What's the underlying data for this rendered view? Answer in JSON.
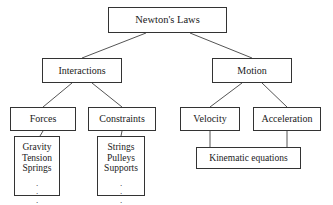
{
  "diagram": {
    "type": "hierarchy-tree",
    "style": {
      "box_border_color": "#333333",
      "box_fill_color": "#ffffff",
      "edge_color": "#555555",
      "text_color": "#1a1a1a",
      "background": "#ffffff"
    },
    "nodes": [
      {
        "id": "newtons-laws",
        "label": "Newton's Laws",
        "level": 0,
        "x": 108,
        "y": 7,
        "w": 119,
        "h": 26,
        "font_size": 10.5
      },
      {
        "id": "interactions",
        "label": "Interactions",
        "level": 1,
        "x": 42,
        "y": 58,
        "w": 80,
        "h": 25,
        "font_size": 10
      },
      {
        "id": "motion",
        "label": "Motion",
        "level": 1,
        "x": 212,
        "y": 58,
        "w": 80,
        "h": 25,
        "font_size": 10
      },
      {
        "id": "forces",
        "label": "Forces",
        "level": 2,
        "x": 10,
        "y": 107,
        "w": 66,
        "h": 24,
        "font_size": 10
      },
      {
        "id": "constraints",
        "label": "Constraints",
        "level": 2,
        "x": 88,
        "y": 107,
        "w": 68,
        "h": 24,
        "font_size": 10
      },
      {
        "id": "velocity",
        "label": "Velocity",
        "level": 2,
        "x": 180,
        "y": 107,
        "w": 60,
        "h": 24,
        "font_size": 10
      },
      {
        "id": "acceleration",
        "label": "Acceleration",
        "level": 2,
        "x": 253,
        "y": 107,
        "w": 68,
        "h": 24,
        "font_size": 10
      },
      {
        "id": "force-types",
        "label_lines": [
          "Gravity",
          "Tension",
          "Springs"
        ],
        "ellipsis": "vertical-dots",
        "level": 3,
        "x": 14,
        "y": 136,
        "w": 46,
        "h": 60,
        "font_size": 9.5
      },
      {
        "id": "constraint-types",
        "label_lines": [
          "Strings",
          "Pulleys",
          "Supports"
        ],
        "ellipsis": "vertical-dots",
        "level": 3,
        "x": 97,
        "y": 136,
        "w": 48,
        "h": 60,
        "font_size": 9.5
      },
      {
        "id": "kinematic-equations",
        "label": "Kinematic equations",
        "level": 3,
        "x": 196,
        "y": 147,
        "w": 105,
        "h": 22,
        "font_size": 9.5
      }
    ],
    "edges": [
      {
        "from": "newtons-laws",
        "to": "interactions",
        "style": "diagonal",
        "x1": 146,
        "y1": 33,
        "x2": 82,
        "y2": 58
      },
      {
        "from": "newtons-laws",
        "to": "motion",
        "style": "diagonal",
        "x1": 190,
        "y1": 33,
        "x2": 252,
        "y2": 58
      },
      {
        "from": "interactions",
        "to": "forces",
        "style": "diagonal",
        "x1": 72,
        "y1": 83,
        "x2": 43,
        "y2": 107
      },
      {
        "from": "interactions",
        "to": "constraints",
        "style": "diagonal",
        "x1": 92,
        "y1": 83,
        "x2": 122,
        "y2": 107
      },
      {
        "from": "motion",
        "to": "velocity",
        "style": "diagonal",
        "x1": 242,
        "y1": 83,
        "x2": 210,
        "y2": 107
      },
      {
        "from": "motion",
        "to": "acceleration",
        "style": "diagonal",
        "x1": 262,
        "y1": 83,
        "x2": 287,
        "y2": 107
      },
      {
        "from": "forces",
        "to": "force-types",
        "style": "vertical",
        "x1": 43,
        "y1": 131,
        "x2": 37,
        "y2": 136
      },
      {
        "from": "constraints",
        "to": "constraint-types",
        "style": "vertical",
        "x1": 122,
        "y1": 131,
        "x2": 121,
        "y2": 136
      },
      {
        "from": "velocity",
        "to": "kinematic-equations",
        "style": "vertical",
        "x1": 210,
        "y1": 131,
        "x2": 210,
        "y2": 147
      },
      {
        "from": "acceleration",
        "to": "kinematic-equations",
        "style": "vertical",
        "x1": 287,
        "y1": 131,
        "x2": 287,
        "y2": 147
      }
    ]
  }
}
